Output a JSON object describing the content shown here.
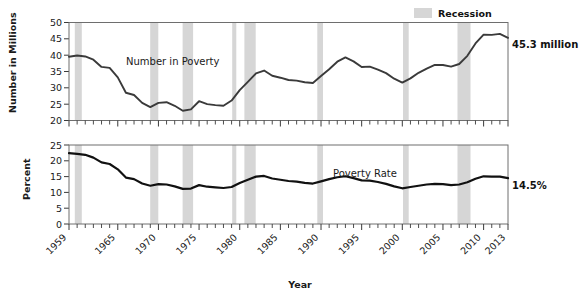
{
  "legend": {
    "recession_label": "Recession",
    "swatch_color": "#d6d6d6"
  },
  "xaxis": {
    "title": "Year",
    "tick_labels": [
      "1959",
      "1965",
      "1970",
      "1975",
      "1980",
      "1985",
      "1990",
      "1995",
      "2000",
      "2005",
      "2010",
      "2013"
    ],
    "tick_years": [
      1959,
      1965,
      1970,
      1975,
      1980,
      1985,
      1990,
      1995,
      2000,
      2005,
      2010,
      2013
    ],
    "range": [
      1959,
      2013
    ]
  },
  "panels": {
    "top": {
      "ylabel": "Number in Millions",
      "series_label": "Number in Poverty",
      "endpoint_label": "45.3 million",
      "ytick_labels": [
        "20",
        "25",
        "30",
        "35",
        "40",
        "45",
        "50"
      ]
    },
    "bottom": {
      "ylabel": "Percent",
      "series_label": "Poverty Rate",
      "endpoint_label": "14.5%",
      "ytick_labels": [
        "0",
        "5",
        "10",
        "15",
        "20",
        "25"
      ]
    }
  },
  "chart_data": [
    {
      "type": "line",
      "title": "Number in Poverty",
      "xlabel": "Year",
      "ylabel": "Number in Millions",
      "ylim": [
        20,
        50
      ],
      "xlim": [
        1959,
        2013
      ],
      "grid": false,
      "legend": "Recession",
      "annotations": [
        "45.3 million"
      ],
      "x": [
        1959,
        1960,
        1961,
        1962,
        1963,
        1964,
        1965,
        1966,
        1967,
        1968,
        1969,
        1970,
        1971,
        1972,
        1973,
        1974,
        1975,
        1976,
        1977,
        1978,
        1979,
        1980,
        1981,
        1982,
        1983,
        1984,
        1985,
        1986,
        1987,
        1988,
        1989,
        1990,
        1991,
        1992,
        1993,
        1994,
        1995,
        1996,
        1997,
        1998,
        1999,
        2000,
        2001,
        2002,
        2003,
        2004,
        2005,
        2006,
        2007,
        2008,
        2009,
        2010,
        2011,
        2012,
        2013
      ],
      "values": [
        39.5,
        39.9,
        39.6,
        38.6,
        36.4,
        36.1,
        33.2,
        28.5,
        27.8,
        25.4,
        24.1,
        25.4,
        25.6,
        24.5,
        23.0,
        23.4,
        25.9,
        25.0,
        24.7,
        24.5,
        26.1,
        29.3,
        31.8,
        34.4,
        35.3,
        33.7,
        33.1,
        32.4,
        32.2,
        31.7,
        31.5,
        33.6,
        35.7,
        38.0,
        39.3,
        38.1,
        36.4,
        36.5,
        35.6,
        34.5,
        32.8,
        31.6,
        32.9,
        34.6,
        35.9,
        37.0,
        37.0,
        36.5,
        37.3,
        39.8,
        43.6,
        46.3,
        46.2,
        46.5,
        45.3
      ]
    },
    {
      "type": "line",
      "title": "Poverty Rate",
      "xlabel": "Year",
      "ylabel": "Percent",
      "ylim": [
        0,
        25
      ],
      "xlim": [
        1959,
        2013
      ],
      "grid": false,
      "legend": "Recession",
      "annotations": [
        "14.5%"
      ],
      "x": [
        1959,
        1960,
        1961,
        1962,
        1963,
        1964,
        1965,
        1966,
        1967,
        1968,
        1969,
        1970,
        1971,
        1972,
        1973,
        1974,
        1975,
        1976,
        1977,
        1978,
        1979,
        1980,
        1981,
        1982,
        1983,
        1984,
        1985,
        1986,
        1987,
        1988,
        1989,
        1990,
        1991,
        1992,
        1993,
        1994,
        1995,
        1996,
        1997,
        1998,
        1999,
        2000,
        2001,
        2002,
        2003,
        2004,
        2005,
        2006,
        2007,
        2008,
        2009,
        2010,
        2011,
        2012,
        2013
      ],
      "values": [
        22.4,
        22.2,
        21.9,
        21.0,
        19.5,
        19.0,
        17.3,
        14.7,
        14.2,
        12.8,
        12.1,
        12.6,
        12.5,
        11.9,
        11.1,
        11.2,
        12.3,
        11.8,
        11.6,
        11.4,
        11.7,
        13.0,
        14.0,
        15.0,
        15.2,
        14.4,
        14.0,
        13.6,
        13.4,
        13.0,
        12.8,
        13.5,
        14.2,
        14.8,
        15.1,
        14.5,
        13.8,
        13.7,
        13.3,
        12.7,
        11.9,
        11.3,
        11.7,
        12.1,
        12.5,
        12.7,
        12.6,
        12.3,
        12.5,
        13.2,
        14.3,
        15.1,
        15.0,
        15.0,
        14.5
      ]
    }
  ],
  "recessions": [
    {
      "start": 1960.3,
      "end": 1961.2
    },
    {
      "start": 1969.9,
      "end": 1970.9
    },
    {
      "start": 1973.9,
      "end": 1975.2
    },
    {
      "start": 1980.0,
      "end": 1980.5
    },
    {
      "start": 1981.5,
      "end": 1982.9
    },
    {
      "start": 1990.5,
      "end": 1991.2
    },
    {
      "start": 2001.2,
      "end": 2001.9
    },
    {
      "start": 2007.9,
      "end": 2009.5
    }
  ]
}
